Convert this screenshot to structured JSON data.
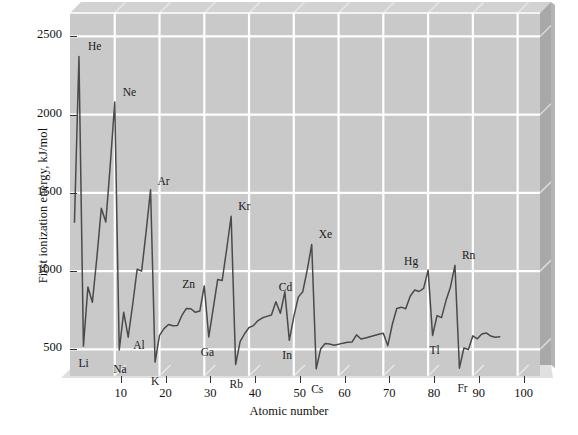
{
  "chart_data": {
    "type": "line",
    "title": "",
    "xlabel": "Atomic number",
    "ylabel": "First ionization energy, kJ/mol",
    "xlim": [
      0,
      105
    ],
    "ylim": [
      330,
      2650
    ],
    "grid": true,
    "legend_position": "none",
    "xticks": [
      10,
      20,
      30,
      40,
      50,
      60,
      70,
      80,
      90,
      100
    ],
    "yticks": [
      500,
      1000,
      1500,
      2000,
      2500
    ],
    "series": [
      {
        "name": "First ionization energy",
        "color": "#4a4a4a",
        "x": [
          1,
          2,
          3,
          4,
          5,
          6,
          7,
          8,
          9,
          10,
          11,
          12,
          13,
          14,
          15,
          16,
          17,
          18,
          19,
          20,
          21,
          22,
          23,
          24,
          25,
          26,
          27,
          28,
          29,
          30,
          31,
          32,
          33,
          34,
          35,
          36,
          37,
          38,
          39,
          40,
          41,
          42,
          43,
          44,
          45,
          46,
          47,
          48,
          49,
          50,
          51,
          52,
          53,
          54,
          55,
          56,
          57,
          58,
          59,
          60,
          61,
          62,
          63,
          64,
          65,
          66,
          67,
          68,
          69,
          70,
          71,
          72,
          73,
          74,
          75,
          76,
          77,
          78,
          79,
          80,
          81,
          82,
          83,
          84,
          85,
          86,
          87,
          88,
          89,
          90,
          91,
          92,
          93,
          94,
          95,
          96
        ],
        "values": [
          1312,
          2372,
          520,
          899,
          801,
          1086,
          1402,
          1314,
          1681,
          2081,
          496,
          738,
          578,
          787,
          1012,
          1000,
          1251,
          1521,
          419,
          590,
          633,
          659,
          651,
          653,
          717,
          762,
          760,
          737,
          745,
          906,
          579,
          762,
          947,
          941,
          1140,
          1351,
          403,
          549,
          600,
          640,
          652,
          684,
          702,
          711,
          720,
          805,
          731,
          868,
          558,
          709,
          834,
          869,
          1008,
          1170,
          376,
          503,
          538,
          534,
          527,
          533,
          540,
          545,
          547,
          593,
          566,
          573,
          581,
          589,
          597,
          603,
          524,
          659,
          761,
          770,
          760,
          840,
          880,
          870,
          890,
          1007,
          589,
          716,
          703,
          812,
          899,
          1037,
          380,
          509,
          499,
          587,
          568,
          598,
          605,
          585,
          578,
          581
        ]
      }
    ],
    "point_labels": [
      {
        "text": "He",
        "x": 2,
        "y": 2372,
        "dx": 9,
        "dy": -3
      },
      {
        "text": "Li",
        "x": 3,
        "y": 520,
        "dx": -5,
        "dy": 24
      },
      {
        "text": "Ne",
        "x": 10,
        "y": 2081,
        "dx": 8,
        "dy": -3
      },
      {
        "text": "Na",
        "x": 11,
        "y": 496,
        "dx": -6,
        "dy": 26
      },
      {
        "text": "Al",
        "x": 13,
        "y": 578,
        "dx": 5,
        "dy": 15
      },
      {
        "text": "Ar",
        "x": 18,
        "y": 1521,
        "dx": 7,
        "dy": -2
      },
      {
        "text": "K",
        "x": 19,
        "y": 419,
        "dx": -4,
        "dy": 26
      },
      {
        "text": "Zn",
        "x": 30,
        "y": 906,
        "dx": -22,
        "dy": 5
      },
      {
        "text": "Ga",
        "x": 31,
        "y": 579,
        "dx": -8,
        "dy": 22
      },
      {
        "text": "Kr",
        "x": 36,
        "y": 1351,
        "dx": 7,
        "dy": -3
      },
      {
        "text": "Rb",
        "x": 37,
        "y": 403,
        "dx": -6,
        "dy": 26
      },
      {
        "text": "Cd",
        "x": 48,
        "y": 868,
        "dx": -6,
        "dy": 2
      },
      {
        "text": "In",
        "x": 49,
        "y": 558,
        "dx": -7,
        "dy": 22
      },
      {
        "text": "Xe",
        "x": 54,
        "y": 1170,
        "dx": 7,
        "dy": -4
      },
      {
        "text": "Cs",
        "x": 55,
        "y": 376,
        "dx": -5,
        "dy": 27
      },
      {
        "text": "Hg",
        "x": 80,
        "y": 1007,
        "dx": -24,
        "dy": -2
      },
      {
        "text": "Tl",
        "x": 81,
        "y": 589,
        "dx": -3,
        "dy": 22
      },
      {
        "text": "Rn",
        "x": 86,
        "y": 1037,
        "dx": 7,
        "dy": -3
      },
      {
        "text": "Fr",
        "x": 87,
        "y": 380,
        "dx": -2,
        "dy": 27
      }
    ],
    "style": {
      "panel_color": "#c9c9c9",
      "panel_top_band": "#d2d2d2",
      "gridline_color": "#ffffff",
      "bevel_light": "#e2e2e2",
      "bevel_dark": "#a8a8a8",
      "line_color": "#4a4a4a",
      "text_color": "#111111"
    }
  }
}
